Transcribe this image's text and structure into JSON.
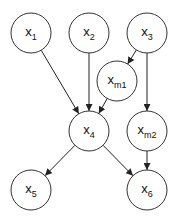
{
  "diagram": {
    "type": "directed-graph",
    "nodes": [
      {
        "id": "x1",
        "base": "x",
        "sub": "1",
        "cx": 31,
        "cy": 33
      },
      {
        "id": "x2",
        "base": "x",
        "sub": "2",
        "cx": 89,
        "cy": 33
      },
      {
        "id": "x3",
        "base": "x",
        "sub": "3",
        "cx": 147,
        "cy": 33
      },
      {
        "id": "xm1",
        "base": "x",
        "sub": "m1",
        "cx": 117,
        "cy": 81
      },
      {
        "id": "x4",
        "base": "x",
        "sub": "4",
        "cx": 89,
        "cy": 131
      },
      {
        "id": "xm2",
        "base": "x",
        "sub": "m2",
        "cx": 147,
        "cy": 131
      },
      {
        "id": "x5",
        "base": "x",
        "sub": "5",
        "cx": 31,
        "cy": 190
      },
      {
        "id": "x6",
        "base": "x",
        "sub": "6",
        "cx": 147,
        "cy": 190
      }
    ],
    "edges": [
      {
        "from": "x1",
        "to": "x4"
      },
      {
        "from": "x2",
        "to": "x4"
      },
      {
        "from": "x3",
        "to": "xm1"
      },
      {
        "from": "xm1",
        "to": "x4"
      },
      {
        "from": "x3",
        "to": "xm2"
      },
      {
        "from": "x4",
        "to": "x5"
      },
      {
        "from": "x4",
        "to": "x6"
      },
      {
        "from": "xm2",
        "to": "x6"
      }
    ],
    "node_radius": 20
  }
}
